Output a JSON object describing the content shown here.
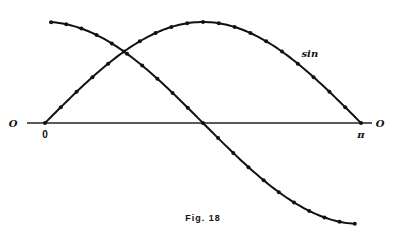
{
  "chart_data": {
    "type": "line",
    "title": "",
    "caption": "Fig. 18",
    "xlabel": "",
    "ylabel": "",
    "axis_end_labels": {
      "left": "O",
      "right": "O"
    },
    "x_ticks": [
      {
        "value": 0,
        "label": "0"
      },
      {
        "value": 3.14159,
        "label": "π"
      }
    ],
    "xlim": [
      0,
      3.14159
    ],
    "ylim": [
      -1,
      1
    ],
    "grid": false,
    "legend": "none",
    "series": [
      {
        "name": "sin",
        "label": "sin",
        "function": "sin(x)",
        "x_start": 0,
        "x_end": 3.14159,
        "marker_count": 21,
        "labeled": true
      },
      {
        "name": "cos",
        "label": "",
        "function": "cos(x)",
        "x_start": 0.06,
        "x_end": 3.08,
        "marker_count": 21,
        "labeled": false
      }
    ]
  }
}
